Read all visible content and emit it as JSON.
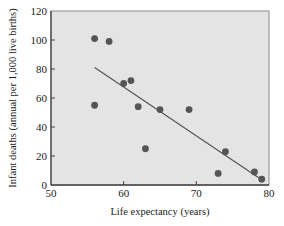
{
  "chart_data": {
    "type": "scatter",
    "title": "",
    "xlabel": "Life expectancy (years)",
    "ylabel": "Infant deaths (annual per 1,000 live births)",
    "xlim": [
      50,
      80
    ],
    "ylim": [
      0,
      120
    ],
    "xticks": [
      50,
      60,
      70,
      80
    ],
    "yticks": [
      0,
      20,
      40,
      60,
      80,
      100,
      120
    ],
    "grid": false,
    "legend": null,
    "plot_background": "#e4e4e4",
    "point_color": "#555555",
    "line_color": "#555555",
    "series": [
      {
        "name": "Countries",
        "points": [
          {
            "x": 56,
            "y": 101
          },
          {
            "x": 58,
            "y": 99
          },
          {
            "x": 56,
            "y": 55
          },
          {
            "x": 60,
            "y": 70
          },
          {
            "x": 61,
            "y": 72
          },
          {
            "x": 62,
            "y": 54
          },
          {
            "x": 63,
            "y": 25
          },
          {
            "x": 65,
            "y": 52
          },
          {
            "x": 69,
            "y": 52
          },
          {
            "x": 73,
            "y": 8
          },
          {
            "x": 74,
            "y": 23
          },
          {
            "x": 78,
            "y": 9
          },
          {
            "x": 79,
            "y": 4
          }
        ]
      }
    ],
    "regression_line": {
      "x1": 56,
      "y1": 81,
      "x2": 79.2,
      "y2": 3
    }
  }
}
